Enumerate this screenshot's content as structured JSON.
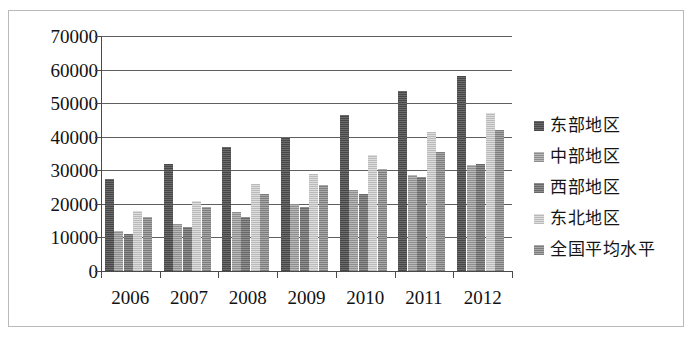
{
  "chart_data": {
    "type": "bar",
    "title": "",
    "subtitle": "",
    "xlabel": "",
    "ylabel": "",
    "categories": [
      "2006",
      "2007",
      "2008",
      "2009",
      "2010",
      "2011",
      "2012"
    ],
    "ylim": [
      0,
      70000
    ],
    "ytick_labels": [
      "70000",
      "60000",
      "50000",
      "40000",
      "30000",
      "20000",
      "10000",
      "0"
    ],
    "yticks": [
      70000,
      60000,
      50000,
      40000,
      30000,
      20000,
      10000,
      0
    ],
    "grid": true,
    "legend_position": "right",
    "series": [
      {
        "name": "东部地区",
        "color": "#5a5a5a",
        "values": [
          27500,
          32000,
          37000,
          40000,
          46500,
          53500,
          58000
        ]
      },
      {
        "name": "中部地区",
        "color": "#a5a5a5",
        "values": [
          12000,
          14000,
          17500,
          20000,
          24000,
          28500,
          31500
        ]
      },
      {
        "name": "西部地区",
        "color": "#7e7e7e",
        "values": [
          11000,
          13000,
          16000,
          19000,
          23000,
          28000,
          32000
        ]
      },
      {
        "name": "东北地区",
        "color": "#cfcfcf",
        "values": [
          18000,
          21000,
          26000,
          29000,
          34500,
          41500,
          47000
        ]
      },
      {
        "name": "全国平均水平",
        "color": "#959595",
        "values": [
          16000,
          19000,
          23000,
          25500,
          30500,
          35500,
          42000
        ]
      }
    ]
  },
  "legend": {
    "items": [
      {
        "label": "东部地区",
        "swatch": "#5a5a5a",
        "swatch_class": "s0"
      },
      {
        "label": "中部地区",
        "swatch": "#a5a5a5",
        "swatch_class": "s1"
      },
      {
        "label": "西部地区",
        "swatch": "#7e7e7e",
        "swatch_class": "s2"
      },
      {
        "label": "东北地区",
        "swatch": "#cfcfcf",
        "swatch_class": "s3"
      },
      {
        "label": "全国平均水平",
        "swatch": "#959595",
        "swatch_class": "s4"
      }
    ]
  }
}
